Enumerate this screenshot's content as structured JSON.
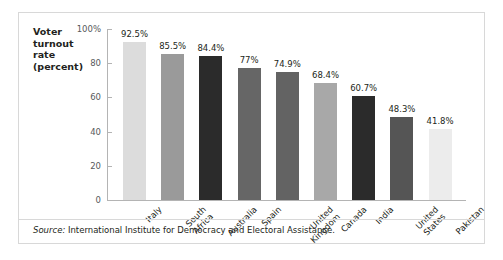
{
  "chart_data": {
    "type": "bar",
    "title": "",
    "subtitle": "",
    "xlabel": "",
    "ylabel": "Voter turnout rate (percent)",
    "ylabel_lines": [
      "Voter",
      "turnout",
      "rate",
      "(percent)"
    ],
    "ylim": [
      0,
      100
    ],
    "yticks": [
      0,
      20,
      40,
      60,
      80,
      100
    ],
    "ytick_labels": [
      "0",
      "20",
      "40",
      "60",
      "80",
      "100%"
    ],
    "grid": false,
    "legend": null,
    "categories": [
      "Italy",
      "South Africa",
      "Australia",
      "Spain",
      "United Kingdom",
      "Canada",
      "India",
      "United States",
      "Pakistan"
    ],
    "category_label_lines": [
      [
        "Italy"
      ],
      [
        "South",
        "Africa"
      ],
      [
        "Australia"
      ],
      [
        "Spain"
      ],
      [
        "United",
        "Kingdom"
      ],
      [
        "Canada"
      ],
      [
        "India"
      ],
      [
        "United",
        "States"
      ],
      [
        "Pakistan"
      ]
    ],
    "values": [
      92.5,
      85.5,
      84.4,
      77,
      74.9,
      68.4,
      60.7,
      48.3,
      41.8
    ],
    "data_labels": [
      "92.5%",
      "85.5%",
      "84.4%",
      "77%",
      "74.9%",
      "68.4%",
      "60.7%",
      "48.3%",
      "41.8%"
    ],
    "bar_colors": [
      "#dcdcdc",
      "#9a9a9a",
      "#2b2b2b",
      "#666666",
      "#636363",
      "#a8a8a8",
      "#2b2b2b",
      "#555555",
      "#ececec"
    ],
    "axis_color": "#b4b4b4",
    "text_color": "#231f20"
  },
  "source": {
    "label": "Source:",
    "text": "International Institute for Democracy and Electoral Assistance."
  }
}
